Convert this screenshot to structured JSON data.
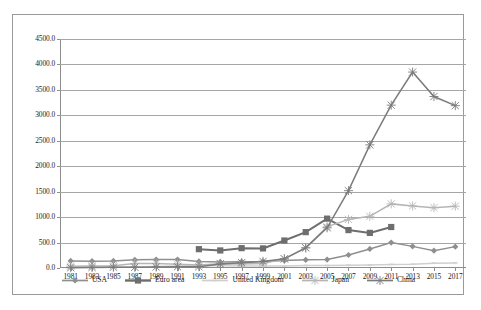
{
  "chart_data": {
    "type": "line",
    "title": "",
    "subtitle": "",
    "xlabel": "",
    "ylabel": "",
    "grid": true,
    "legend_position": "bottom",
    "ylim": [
      0,
      4500
    ],
    "ytick_step": 500,
    "ytick_labels": [
      "0.0",
      "500.0",
      "1000.0",
      "1500.0",
      "2000.0",
      "2500.0",
      "3000.0",
      "3500.0",
      "4000.0",
      "4500.0"
    ],
    "ytick_values": [
      0,
      500,
      1000,
      1500,
      2000,
      2500,
      3000,
      3500,
      4000,
      4500
    ],
    "categories": [
      "1981",
      "1983",
      "1985",
      "1987",
      "1989",
      "1991",
      "1993",
      "1995",
      "1997",
      "1999",
      "2001",
      "2003",
      "2005",
      "2007",
      "2009",
      "2011",
      "2013",
      "2015",
      "2017"
    ],
    "x": [
      1981,
      1983,
      1985,
      1987,
      1989,
      1991,
      1993,
      1995,
      1997,
      1999,
      2001,
      2003,
      2005,
      2007,
      2009,
      2011,
      2013,
      2015,
      2017
    ],
    "series": [
      {
        "name": "USA",
        "color": "#8f8f8f",
        "marker": "diamond",
        "values": [
          140,
          135,
          140,
          160,
          165,
          165,
          130,
          120,
          125,
          130,
          145,
          160,
          165,
          255,
          375,
          500,
          425,
          340,
          420
        ]
      },
      {
        "name": "Euro area",
        "color": "#6e6e6e",
        "marker": "square",
        "values": [
          null,
          null,
          null,
          null,
          null,
          null,
          370,
          345,
          390,
          385,
          540,
          705,
          970,
          745,
          690,
          805,
          null,
          null,
          null
        ]
      },
      {
        "name": "United Kingdom",
        "color": "#cfcfcf",
        "marker": "line",
        "values": [
          20,
          20,
          20,
          25,
          30,
          40,
          45,
          45,
          40,
          40,
          40,
          50,
          50,
          55,
          60,
          70,
          75,
          95,
          100
        ]
      },
      {
        "name": "Japan",
        "color": "#b5b5b5",
        "marker": "x",
        "values": [
          35,
          40,
          45,
          90,
          90,
          75,
          60,
          85,
          80,
          90,
          180,
          400,
          810,
          955,
          1015,
          1260,
          1220,
          1185,
          1215
        ]
      },
      {
        "name": "China",
        "color": "#7b7b7b",
        "marker": "x",
        "values": [
          5,
          10,
          15,
          15,
          20,
          25,
          25,
          80,
          105,
          130,
          180,
          395,
          790,
          1520,
          2420,
          3200,
          3850,
          3370,
          3190
        ]
      }
    ]
  },
  "legend": {
    "items": [
      {
        "label": "USA"
      },
      {
        "label": "Euro area"
      },
      {
        "label": "United Kingdom"
      },
      {
        "label": "Japan"
      },
      {
        "label": "China"
      }
    ]
  }
}
